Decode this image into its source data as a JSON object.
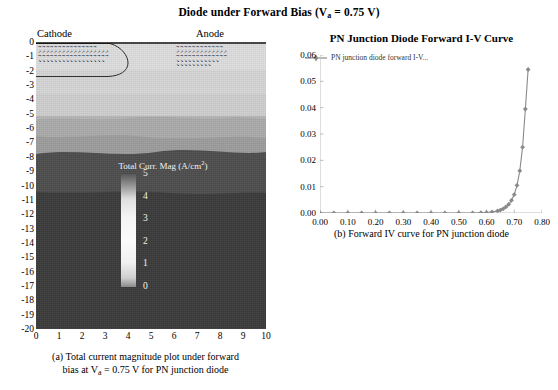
{
  "figure": {
    "title_main": "Diode under Forward Bias (V",
    "title_sub": "a",
    "title_tail": " = 0.75 V)"
  },
  "left_panel": {
    "electrode_labels": {
      "cathode": "Cathode",
      "anode": "Anode"
    },
    "y_ticks": [
      "0",
      "-1",
      "-2",
      "-3",
      "-4",
      "-5",
      "-6",
      "-7",
      "-8",
      "-9",
      "-10",
      "-11",
      "-12",
      "-13",
      "-14",
      "-15",
      "-16",
      "-17",
      "-18",
      "-19",
      "-20"
    ],
    "x_ticks": [
      "0",
      "1",
      "2",
      "3",
      "4",
      "5",
      "6",
      "7",
      "8",
      "9",
      "10"
    ],
    "colorbar": {
      "title_text": "Total Curr. Mag (A/cm",
      "title_sup": "2",
      "title_close": ")",
      "ticks": [
        "5",
        "4",
        "3",
        "2",
        "1",
        "0"
      ],
      "min": 0,
      "max": 5
    },
    "caption_line1": "(a) Total current magnitude plot under forward",
    "caption_line2_pre": "bias at V",
    "caption_line2_sub": "a",
    "caption_line2_post": " = 0.75 V for PN junction diode",
    "layer_colors": [
      "#dcdcdc",
      "#d2d2d2",
      "#9f9f9f",
      "#4a4a4a",
      "#3a3a3a"
    ]
  },
  "right_panel": {
    "caption": "(b) Forward IV curve for PN junction diode",
    "legend_label": "PN junction diode forward I-V...",
    "series_color": "#8a8a8a"
  },
  "chart_data": {
    "type": "line",
    "title": "PN Junction Diode Forward I-V Curve",
    "xlabel": "",
    "ylabel": "",
    "xlim": [
      0.0,
      0.8
    ],
    "ylim": [
      0.0,
      0.06
    ],
    "xticks": [
      "0.00",
      "0.10",
      "0.20",
      "0.30",
      "0.40",
      "0.50",
      "0.60",
      "0.70",
      "0.80"
    ],
    "xtick_values": [
      0.0,
      0.1,
      0.2,
      0.3,
      0.4,
      0.5,
      0.6,
      0.7,
      0.8
    ],
    "yticks": [
      "0.00",
      "0.01",
      "0.02",
      "0.03",
      "0.04",
      "0.05",
      "0.06"
    ],
    "ytick_values": [
      0.0,
      0.01,
      0.02,
      0.03,
      0.04,
      0.05,
      0.06
    ],
    "grid": false,
    "legend_position": "top-left",
    "marker": "diamond",
    "series": [
      {
        "name": "PN junction diode forward I-V...",
        "x": [
          0.0,
          0.05,
          0.1,
          0.15,
          0.2,
          0.25,
          0.3,
          0.35,
          0.4,
          0.45,
          0.5,
          0.55,
          0.58,
          0.6,
          0.62,
          0.64,
          0.65,
          0.66,
          0.67,
          0.68,
          0.69,
          0.7,
          0.71,
          0.72,
          0.73,
          0.74,
          0.75
        ],
        "y": [
          0.0,
          0.0,
          0.0,
          0.0,
          0.0,
          0.0,
          0.0,
          0.0,
          0.0,
          0.0,
          0.0,
          0.0,
          0.0001,
          0.0002,
          0.0004,
          0.0008,
          0.0011,
          0.0016,
          0.0023,
          0.0033,
          0.0048,
          0.007,
          0.0105,
          0.016,
          0.025,
          0.0395,
          0.0545
        ]
      }
    ]
  }
}
